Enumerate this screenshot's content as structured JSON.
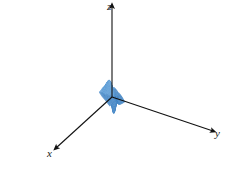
{
  "figure": {
    "kind": "3d-surface-wireframe-plot",
    "width": 228,
    "height": 183,
    "background_color": "#ffffff"
  },
  "axes": {
    "origin": {
      "x": 112,
      "y": 97
    },
    "z": {
      "label": "z",
      "name": "z-axis",
      "tip": {
        "x": 112,
        "y": 6
      },
      "has_arrowhead": true,
      "label_position": {
        "x": 107,
        "y": 1
      }
    },
    "y": {
      "label": "y",
      "name": "y-axis",
      "tip": {
        "x": 213,
        "y": 131
      },
      "has_arrowhead": true,
      "label_position": {
        "x": 215,
        "y": 128
      }
    },
    "x": {
      "label": "x",
      "name": "x-axis",
      "tip": {
        "x": 56,
        "y": 148
      },
      "has_arrowhead": true,
      "label_position": {
        "x": 47,
        "y": 148
      }
    },
    "axis_color": "#111111",
    "axis_stroke_width": 1.1
  },
  "surface": {
    "fill_color": "#c3daef",
    "fill_color_light": "#d8e8f6",
    "fill_color_dark": "#9cc4e4",
    "mesh_line_color": "#5a9bd4",
    "mesh_line_color_dark": "#3f82c2",
    "mesh_line_width": 0.45,
    "grid_u_count": 34,
    "grid_v_count": 34,
    "description": "Smooth saddle-like surface: tall rounded ridge rising at the upper-left, a central fold/peak adjacent to the z-axis, a deep circular basin in the lower-center-right, and a broad flat plateau sweeping to the right toward the y-axis.",
    "features": [
      {
        "name": "upper-left-ridge",
        "screen_x": 55,
        "screen_y": 40
      },
      {
        "name": "central-peak",
        "screen_x": 112,
        "screen_y": 30
      },
      {
        "name": "lower-basin",
        "screen_x": 140,
        "screen_y": 140
      },
      {
        "name": "right-plateau",
        "screen_x": 195,
        "screen_y": 95
      }
    ]
  },
  "chart_data": {
    "type": "surface",
    "title": "",
    "xlabel": "x",
    "ylabel": "y",
    "zlabel": "z",
    "grid": true,
    "legend": "none",
    "projection": {
      "azimuth_deg": 35,
      "elevation_deg": 22,
      "scale_x": 3.05,
      "scale_y": 3.05,
      "scale_z": 19.0
    },
    "domain": {
      "u": [
        -3.0,
        3.0
      ],
      "v": [
        -3.0,
        3.0
      ],
      "samples_u": 34,
      "samples_v": 34
    },
    "zlim": [
      -1.1,
      1.35
    ],
    "function": "ridge_and_basin",
    "function_params": {
      "ridge_amp": 1.0,
      "ridge_cx": -1.15,
      "ridge_cy": -0.35,
      "ridge_sx": 1.15,
      "ridge_sy": 2.4,
      "basin_amp": -1.05,
      "basin_cx": 1.05,
      "basin_cy": 0.55,
      "basin_sx": 1.0,
      "basin_sy": 1.0,
      "plateau_amp": 0.16,
      "tilt_x": -0.02,
      "tilt_y": 0.05
    }
  }
}
